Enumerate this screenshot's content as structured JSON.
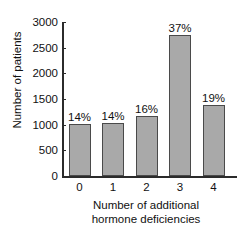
{
  "chart_data": {
    "type": "bar",
    "title": "",
    "subtitle": "",
    "xlabel_lines": [
      "Number of additional",
      "hormone deficiencies"
    ],
    "xlabel": "Number of additional hormone deficiencies",
    "ylabel": "Number of patients",
    "categories": [
      "0",
      "1",
      "2",
      "3",
      "4"
    ],
    "values": [
      1010,
      1040,
      1160,
      2750,
      1380
    ],
    "data_labels": [
      "14%",
      "14%",
      "16%",
      "37%",
      "19%"
    ],
    "ylim": [
      0,
      3000
    ],
    "yticks": [
      3000,
      2500,
      2000,
      1500,
      1000,
      500,
      0
    ],
    "ytick_labels": [
      "3000",
      "2500",
      "2000",
      "1500",
      "1000",
      "500",
      "0"
    ],
    "grid": false,
    "legend": false,
    "legend_position": "none",
    "bar_fill_color": "#a9a9a9",
    "bar_edge_color": "#4a4a4a",
    "axis_color": "#2b2b2b",
    "text_color": "#111111",
    "background_color": "#ffffff"
  }
}
